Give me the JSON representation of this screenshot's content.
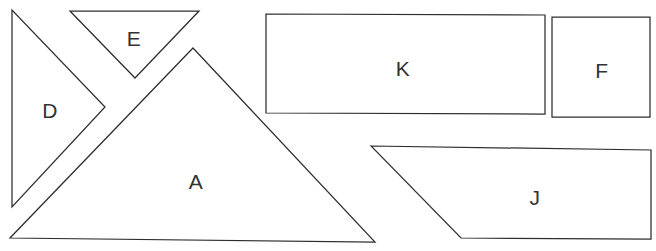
{
  "figure": {
    "background_color": "#ffffff",
    "stroke_color": "#2e2e2e",
    "label_color": "#333333",
    "width": 656,
    "height": 251
  },
  "shapes": [
    {
      "id": "shape-d",
      "label": "D",
      "kind": "triangle",
      "points": "12,10 12,207 105,107",
      "label_x": 50,
      "label_y": 110
    },
    {
      "id": "shape-e",
      "label": "E",
      "kind": "triangle",
      "points": "70,11 199,11 135,78",
      "label_x": 134,
      "label_y": 38
    },
    {
      "id": "shape-a",
      "label": "A",
      "kind": "triangle",
      "points": "193,48 375,242 10,238",
      "label_x": 196,
      "label_y": 181
    },
    {
      "id": "shape-k",
      "label": "K",
      "kind": "rectangle",
      "points": "266,14 545,15 545,114 266,113",
      "label_x": 403,
      "label_y": 68
    },
    {
      "id": "shape-f",
      "label": "F",
      "kind": "square",
      "points": "552,17 650,17 650,117 552,117",
      "label_x": 602,
      "label_y": 70
    },
    {
      "id": "shape-j",
      "label": "J",
      "kind": "trapezoid",
      "points": "371,146 651,150 651,239 461,238",
      "label_x": 535,
      "label_y": 197
    }
  ]
}
